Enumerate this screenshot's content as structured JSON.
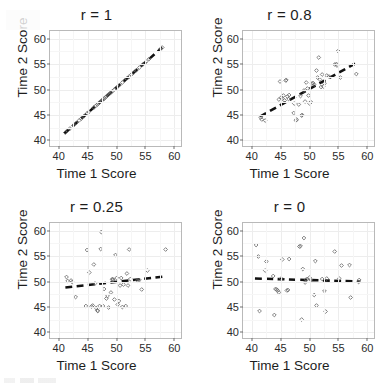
{
  "figure": {
    "name": "correlation-scatterplot-grid",
    "layout": "2x2",
    "axis": {
      "xlabel": "Time 1 Score",
      "ylabel": "Time 2 Score",
      "xticks": [
        "40",
        "45",
        "50",
        "55",
        "60"
      ],
      "yticks": [
        "40",
        "45",
        "50",
        "55",
        "60"
      ],
      "xlim": [
        38.5,
        61.5
      ],
      "ylim": [
        38.5,
        61.5
      ]
    },
    "colors": {
      "panel_border": "#b9b9b9",
      "gridline": "#ededed",
      "point_stroke": "#6b6b6b",
      "trend_line": "#111111",
      "text": "#1d1d1d",
      "background": "#ffffff"
    }
  },
  "chart_data": [
    {
      "type": "scatter",
      "title": "r = 1",
      "xlabel": "Time 1 Score",
      "ylabel": "Time 2 Score",
      "xlim": [
        38.5,
        61.5
      ],
      "ylim": [
        38.5,
        61.5
      ],
      "xticks": [
        40,
        45,
        50,
        55,
        60
      ],
      "yticks": [
        40,
        45,
        50,
        55,
        60
      ],
      "grid": true,
      "legend": "none",
      "correlation": 1,
      "marker": "open-diamond",
      "trendline": {
        "style": "dashed",
        "x": [
          41.0,
          58.2
        ],
        "y": [
          41.0,
          58.2
        ]
      },
      "points": [
        [
          41.2,
          41.2
        ],
        [
          41.6,
          41.6
        ],
        [
          42.0,
          42.0
        ],
        [
          42.6,
          42.6
        ],
        [
          43.1,
          43.1
        ],
        [
          43.6,
          43.6
        ],
        [
          44.0,
          44.0
        ],
        [
          44.5,
          44.5
        ],
        [
          45.0,
          45.0
        ],
        [
          45.3,
          45.3
        ],
        [
          46.2,
          46.2
        ],
        [
          46.5,
          46.5
        ],
        [
          46.8,
          46.8
        ],
        [
          47.0,
          47.0
        ],
        [
          47.2,
          47.2
        ],
        [
          47.4,
          47.4
        ],
        [
          47.6,
          47.6
        ],
        [
          47.8,
          47.8
        ],
        [
          48.0,
          48.0
        ],
        [
          48.2,
          48.2
        ],
        [
          48.4,
          48.4
        ],
        [
          48.6,
          48.6
        ],
        [
          48.8,
          48.8
        ],
        [
          49.0,
          49.0
        ],
        [
          49.2,
          49.2
        ],
        [
          49.5,
          49.5
        ],
        [
          49.8,
          49.8
        ],
        [
          50.1,
          50.1
        ],
        [
          50.4,
          50.4
        ],
        [
          50.7,
          50.7
        ],
        [
          51.2,
          51.2
        ],
        [
          51.6,
          51.6
        ],
        [
          52.0,
          52.0
        ],
        [
          52.4,
          52.4
        ],
        [
          52.8,
          52.8
        ],
        [
          53.2,
          53.2
        ],
        [
          53.7,
          53.7
        ],
        [
          54.2,
          54.2
        ],
        [
          54.8,
          54.8
        ],
        [
          55.4,
          55.4
        ],
        [
          55.9,
          55.9
        ],
        [
          57.9,
          57.9
        ],
        [
          58.2,
          58.2
        ]
      ]
    },
    {
      "type": "scatter",
      "title": "r = 0.8",
      "xlabel": "Time 1 Score",
      "ylabel": "Time 2 Score",
      "xlim": [
        38.5,
        61.5
      ],
      "ylim": [
        38.5,
        61.5
      ],
      "xticks": [
        40,
        45,
        50,
        55,
        60
      ],
      "yticks": [
        40,
        45,
        50,
        55,
        60
      ],
      "grid": true,
      "legend": "none",
      "correlation": 0.8,
      "marker": "open-diamond",
      "trendline": {
        "style": "dashed",
        "x": [
          41.5,
          58.5
        ],
        "y": [
          44.4,
          55.2
        ]
      },
      "points": [
        [
          41.6,
          44.2
        ],
        [
          41.8,
          43.8
        ],
        [
          42.4,
          43.6
        ],
        [
          44.8,
          47.8
        ],
        [
          45.0,
          51.4
        ],
        [
          45.2,
          48.2
        ],
        [
          45.4,
          48.0
        ],
        [
          45.6,
          48.6
        ],
        [
          45.8,
          47.6
        ],
        [
          46.0,
          51.6
        ],
        [
          46.1,
          51.7
        ],
        [
          46.3,
          48.4
        ],
        [
          46.5,
          47.9
        ],
        [
          46.6,
          48.7
        ],
        [
          47.4,
          45.1
        ],
        [
          47.5,
          47.0
        ],
        [
          47.8,
          43.6
        ],
        [
          47.9,
          43.8
        ],
        [
          48.3,
          46.8
        ],
        [
          48.6,
          48.5
        ],
        [
          48.8,
          44.6
        ],
        [
          48.9,
          44.7
        ],
        [
          49.2,
          49.6
        ],
        [
          49.4,
          47.4
        ],
        [
          49.6,
          51.2
        ],
        [
          49.8,
          50.0
        ],
        [
          50.0,
          48.6
        ],
        [
          50.2,
          47.0
        ],
        [
          50.4,
          47.3
        ],
        [
          50.6,
          51.0
        ],
        [
          50.8,
          51.1
        ],
        [
          51.0,
          50.8
        ],
        [
          51.4,
          53.6
        ],
        [
          51.6,
          52.2
        ],
        [
          51.8,
          56.2
        ],
        [
          52.0,
          51.8
        ],
        [
          52.2,
          50.3
        ],
        [
          52.4,
          52.8
        ],
        [
          52.6,
          50.4
        ],
        [
          52.8,
          51.0
        ],
        [
          53.2,
          52.6
        ],
        [
          53.6,
          52.4
        ],
        [
          54.6,
          54.8
        ],
        [
          54.9,
          54.9
        ],
        [
          55.0,
          54.6
        ],
        [
          55.2,
          57.5
        ],
        [
          55.6,
          52.2
        ],
        [
          58.4,
          52.9
        ]
      ]
    },
    {
      "type": "scatter",
      "title": "r = 0.25",
      "xlabel": "Time 1 Score",
      "ylabel": "Time 2 Score",
      "xlim": [
        38.5,
        61.5
      ],
      "ylim": [
        38.5,
        61.5
      ],
      "xticks": [
        40,
        45,
        50,
        55,
        60
      ],
      "yticks": [
        40,
        45,
        50,
        55,
        60
      ],
      "grid": true,
      "legend": "none",
      "correlation": 0.25,
      "marker": "open-diamond",
      "trendline": {
        "style": "dashed",
        "x": [
          41.2,
          58.6
        ],
        "y": [
          48.6,
          50.8
        ]
      },
      "points": [
        [
          41.4,
          50.7
        ],
        [
          41.6,
          49.9
        ],
        [
          42.2,
          50.0
        ],
        [
          42.4,
          49.7
        ],
        [
          43.0,
          46.7
        ],
        [
          44.8,
          44.9
        ],
        [
          45.0,
          56.1
        ],
        [
          45.4,
          51.6
        ],
        [
          45.8,
          44.8
        ],
        [
          46.0,
          45.0
        ],
        [
          46.2,
          53.2
        ],
        [
          46.4,
          49.4
        ],
        [
          46.6,
          44.5
        ],
        [
          46.8,
          44.0
        ],
        [
          46.9,
          43.9
        ],
        [
          47.2,
          44.9
        ],
        [
          47.4,
          56.3
        ],
        [
          47.5,
          59.7
        ],
        [
          47.8,
          44.9
        ],
        [
          48.0,
          48.3
        ],
        [
          48.4,
          46.4
        ],
        [
          48.6,
          46.9
        ],
        [
          48.8,
          44.6
        ],
        [
          49.2,
          47.6
        ],
        [
          49.4,
          50.2
        ],
        [
          49.5,
          50.3
        ],
        [
          49.6,
          50.1
        ],
        [
          49.8,
          46.2
        ],
        [
          50.0,
          55.1
        ],
        [
          50.2,
          50.5
        ],
        [
          50.4,
          45.2
        ],
        [
          50.6,
          45.9
        ],
        [
          50.8,
          49.0
        ],
        [
          51.0,
          50.5
        ],
        [
          51.2,
          44.7
        ],
        [
          51.4,
          49.2
        ],
        [
          51.8,
          44.9
        ],
        [
          52.0,
          51.4
        ],
        [
          52.2,
          49.0
        ],
        [
          52.4,
          56.2
        ],
        [
          52.6,
          50.3
        ],
        [
          53.8,
          50.0
        ],
        [
          54.2,
          50.1
        ],
        [
          54.6,
          48.2
        ],
        [
          55.6,
          52.0
        ],
        [
          58.8,
          56.2
        ]
      ]
    },
    {
      "type": "scatter",
      "title": "r = 0",
      "xlabel": "Time 1 Score",
      "ylabel": "Time 2 Score",
      "xlim": [
        38.5,
        61.5
      ],
      "ylim": [
        38.5,
        61.5
      ],
      "xticks": [
        40,
        45,
        50,
        55,
        60
      ],
      "yticks": [
        40,
        45,
        50,
        55,
        60
      ],
      "grid": true,
      "legend": "none",
      "correlation": 0,
      "marker": "open-diamond",
      "trendline": {
        "style": "dashed",
        "x": [
          40.6,
          59.0
        ],
        "y": [
          50.4,
          49.8
        ]
      },
      "points": [
        [
          40.8,
          57.1
        ],
        [
          41.2,
          54.8
        ],
        [
          41.4,
          43.9
        ],
        [
          42.4,
          52.0
        ],
        [
          42.6,
          53.8
        ],
        [
          43.8,
          50.9
        ],
        [
          44.0,
          43.1
        ],
        [
          44.2,
          48.3
        ],
        [
          44.4,
          48.2
        ],
        [
          44.6,
          48.0
        ],
        [
          44.8,
          47.6
        ],
        [
          45.2,
          50.4
        ],
        [
          45.4,
          54.2
        ],
        [
          46.2,
          48.0
        ],
        [
          46.4,
          48.1
        ],
        [
          46.6,
          54.3
        ],
        [
          48.4,
          56.8
        ],
        [
          48.6,
          56.9
        ],
        [
          48.8,
          42.2
        ],
        [
          49.0,
          52.3
        ],
        [
          49.2,
          58.5
        ],
        [
          49.4,
          49.6
        ],
        [
          49.6,
          50.2
        ],
        [
          49.8,
          50.3
        ],
        [
          50.2,
          50.6
        ],
        [
          50.4,
          50.1
        ],
        [
          51.0,
          47.1
        ],
        [
          51.2,
          53.9
        ],
        [
          51.4,
          45.0
        ],
        [
          52.4,
          50.3
        ],
        [
          52.8,
          47.9
        ],
        [
          53.0,
          43.8
        ],
        [
          53.2,
          50.4
        ],
        [
          54.6,
          55.8
        ],
        [
          55.4,
          50.4
        ],
        [
          55.8,
          53.0
        ],
        [
          57.2,
          53.1
        ],
        [
          57.4,
          46.6
        ],
        [
          58.8,
          49.7
        ],
        [
          58.9,
          50.1
        ]
      ]
    }
  ]
}
